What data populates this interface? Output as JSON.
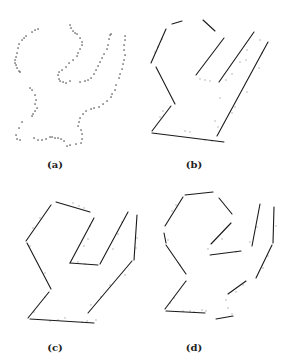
{
  "figure": {
    "panels": [
      {
        "id": "a",
        "label": "(a)",
        "label_pos": [
          55,
          159
        ],
        "description": "scattered edge points",
        "points": [
          [
            38,
            29
          ],
          [
            35,
            30
          ],
          [
            32,
            32
          ],
          [
            26,
            36
          ],
          [
            24,
            38
          ],
          [
            22,
            40
          ],
          [
            19,
            44
          ],
          [
            18,
            48
          ],
          [
            17,
            53
          ],
          [
            16,
            57
          ],
          [
            15,
            60
          ],
          [
            15,
            63
          ],
          [
            16,
            65
          ],
          [
            17,
            68
          ],
          [
            19,
            71
          ],
          [
            20,
            72
          ],
          [
            70,
            25
          ],
          [
            71,
            28
          ],
          [
            73,
            31
          ],
          [
            75,
            33
          ],
          [
            77,
            34
          ],
          [
            80,
            38
          ],
          [
            82,
            42
          ],
          [
            82,
            45
          ],
          [
            80,
            49
          ],
          [
            78,
            53
          ],
          [
            77,
            56
          ],
          [
            73,
            60
          ],
          [
            69,
            63
          ],
          [
            66,
            67
          ],
          [
            62,
            70
          ],
          [
            59,
            72
          ],
          [
            58,
            75
          ],
          [
            59,
            79
          ],
          [
            60,
            81
          ],
          [
            63,
            82
          ],
          [
            66,
            83
          ],
          [
            70,
            81
          ],
          [
            80,
            82
          ],
          [
            85,
            81
          ],
          [
            88,
            80
          ],
          [
            91,
            78
          ],
          [
            94,
            74
          ],
          [
            96,
            70
          ],
          [
            98,
            66
          ],
          [
            100,
            62
          ],
          [
            102,
            58
          ],
          [
            104,
            54
          ],
          [
            107,
            49
          ],
          [
            108,
            45
          ],
          [
            109,
            39
          ],
          [
            110,
            35
          ],
          [
            111,
            34
          ],
          [
            125,
            36
          ],
          [
            125,
            40
          ],
          [
            124,
            45
          ],
          [
            124,
            50
          ],
          [
            125,
            55
          ],
          [
            124,
            60
          ],
          [
            123,
            64
          ],
          [
            122,
            69
          ],
          [
            120,
            74
          ],
          [
            119,
            78
          ],
          [
            116,
            85
          ],
          [
            115,
            90
          ],
          [
            112,
            94
          ],
          [
            111,
            97
          ],
          [
            107,
            101
          ],
          [
            103,
            104
          ],
          [
            99,
            107
          ],
          [
            94,
            108
          ],
          [
            91,
            109
          ],
          [
            86,
            111
          ],
          [
            83,
            114
          ],
          [
            80,
            118
          ],
          [
            79,
            122
          ],
          [
            78,
            126
          ],
          [
            81,
            130
          ],
          [
            82,
            134
          ],
          [
            82,
            139
          ],
          [
            81,
            143
          ],
          [
            76,
            144
          ],
          [
            70,
            145
          ],
          [
            67,
            146
          ],
          [
            30,
            88
          ],
          [
            32,
            90
          ],
          [
            35,
            95
          ],
          [
            36,
            100
          ],
          [
            35,
            104
          ],
          [
            37,
            108
          ],
          [
            35,
            111
          ],
          [
            33,
            114
          ],
          [
            32,
            116
          ],
          [
            22,
            122
          ],
          [
            19,
            128
          ],
          [
            16,
            135
          ],
          [
            17,
            139
          ],
          [
            20,
            140
          ],
          [
            34,
            138
          ],
          [
            38,
            140
          ],
          [
            42,
            140
          ],
          [
            46,
            139
          ],
          [
            50,
            137
          ],
          [
            52,
            137
          ],
          [
            55,
            138
          ],
          [
            58,
            138
          ],
          [
            61,
            139
          ],
          [
            64,
            141
          ]
        ]
      },
      {
        "id": "b",
        "label": "(b)",
        "label_pos": [
          194,
          159
        ],
        "description": "fitted line segments",
        "segments": [
          [
            172,
            24,
            182,
            21
          ],
          [
            203,
            20,
            215,
            31
          ],
          [
            166,
            29,
            151,
            63
          ],
          [
            156,
            67,
            175,
            104
          ],
          [
            224,
            38,
            196,
            75
          ],
          [
            254,
            32,
            219,
            82
          ],
          [
            268,
            42,
            217,
            136
          ],
          [
            171,
            106,
            152,
            131
          ],
          [
            152,
            133,
            224,
            142
          ]
        ],
        "noise": [
          [
            158,
            47
          ],
          [
            155,
            52
          ],
          [
            162,
            39
          ],
          [
            200,
            79
          ],
          [
            205,
            80
          ],
          [
            210,
            81
          ],
          [
            226,
            80
          ],
          [
            232,
            74
          ],
          [
            240,
            62
          ],
          [
            247,
            50
          ],
          [
            260,
            40
          ],
          [
            262,
            53
          ],
          [
            259,
            68
          ],
          [
            247,
            92
          ],
          [
            235,
            107
          ],
          [
            232,
            113
          ],
          [
            215,
            121
          ],
          [
            218,
            127
          ],
          [
            185,
            131
          ],
          [
            190,
            132
          ],
          [
            205,
            140
          ],
          [
            212,
            141
          ],
          [
            160,
            117
          ],
          [
            163,
            111
          ],
          [
            246,
            60
          ],
          [
            220,
            98
          ]
        ]
      },
      {
        "id": "c",
        "label": "(c)",
        "label_pos": [
          55,
          342
        ],
        "description": "fitted line segments",
        "segments": [
          [
            56,
            202,
            90,
            212
          ],
          [
            51,
            205,
            26,
            241
          ],
          [
            27,
            243,
            51,
            289
          ],
          [
            94,
            218,
            70,
            263
          ],
          [
            70,
            263,
            98,
            265
          ],
          [
            128,
            212,
            100,
            264
          ],
          [
            137,
            215,
            134,
            260
          ],
          [
            132,
            261,
            88,
            313
          ],
          [
            49,
            292,
            28,
            318
          ],
          [
            30,
            319,
            94,
            323
          ]
        ],
        "noise": [
          [
            73,
            203
          ],
          [
            79,
            206
          ],
          [
            84,
            208
          ],
          [
            40,
            218
          ],
          [
            33,
            228
          ],
          [
            30,
            246
          ],
          [
            45,
            273
          ],
          [
            90,
            226
          ],
          [
            88,
            239
          ],
          [
            84,
            246
          ],
          [
            78,
            262
          ],
          [
            85,
            264
          ],
          [
            122,
            222
          ],
          [
            118,
            234
          ],
          [
            113,
            249
          ],
          [
            137,
            238
          ],
          [
            136,
            248
          ],
          [
            125,
            275
          ],
          [
            110,
            285
          ],
          [
            101,
            297
          ],
          [
            91,
            305
          ],
          [
            45,
            297
          ],
          [
            34,
            312
          ],
          [
            50,
            321
          ],
          [
            58,
            320
          ],
          [
            65,
            318
          ],
          [
            82,
            322
          ],
          [
            87,
            321
          ],
          [
            96,
            320
          ]
        ]
      },
      {
        "id": "d",
        "label": "(d)",
        "label_pos": [
          194,
          342
        ],
        "description": "fitted line segments",
        "segments": [
          [
            185,
            195,
            213,
            192
          ],
          [
            183,
            197,
            165,
            226
          ],
          [
            164,
            233,
            166,
            243
          ],
          [
            166,
            245,
            186,
            274
          ],
          [
            219,
            198,
            232,
            214
          ],
          [
            231,
            223,
            211,
            244
          ],
          [
            210,
            255,
            241,
            251
          ],
          [
            260,
            204,
            252,
            246
          ],
          [
            274,
            207,
            273,
            243
          ],
          [
            272,
            245,
            256,
            278
          ],
          [
            246,
            281,
            228,
            294
          ],
          [
            186,
            281,
            165,
            309
          ],
          [
            166,
            311,
            205,
            313
          ],
          [
            216,
            319,
            233,
            316
          ]
        ],
        "noise": [
          [
            172,
            211
          ],
          [
            176,
            205
          ],
          [
            168,
            240
          ],
          [
            180,
            265
          ],
          [
            208,
            249
          ],
          [
            222,
            239
          ],
          [
            236,
            252
          ],
          [
            250,
            242
          ],
          [
            257,
            227
          ],
          [
            276,
            226
          ],
          [
            268,
            256
          ],
          [
            263,
            268
          ],
          [
            243,
            285
          ],
          [
            236,
            292
          ],
          [
            226,
            300
          ],
          [
            228,
            308
          ],
          [
            232,
            314
          ],
          [
            174,
            298
          ],
          [
            170,
            303
          ],
          [
            183,
            311
          ],
          [
            190,
            311
          ],
          [
            194,
            312
          ],
          [
            202,
            310
          ],
          [
            206,
            311
          ]
        ]
      }
    ]
  }
}
